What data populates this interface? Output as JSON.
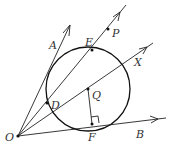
{
  "figure": {
    "type": "geometry-diagram",
    "points": {
      "O": {
        "label": "O",
        "x": 18,
        "y": 136
      },
      "D": {
        "label": "D",
        "x": 47,
        "y": 103
      },
      "E": {
        "label": "E",
        "x": 92,
        "y": 50
      },
      "P": {
        "label": "P",
        "x": 108,
        "y": 29
      },
      "Q": {
        "label": "Q",
        "x": 88,
        "y": 89
      },
      "F": {
        "label": "F",
        "x": 92,
        "y": 124
      }
    },
    "ray_labels": {
      "A": "A",
      "X": "X",
      "B": "B"
    },
    "circle": {
      "center": "Q",
      "cx": 88,
      "cy": 89,
      "r": 42
    },
    "right_angle_marker": "at F between QF and OB"
  }
}
